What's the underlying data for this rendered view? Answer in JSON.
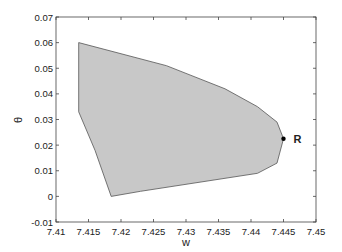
{
  "chart_data": {
    "type": "area",
    "title": "",
    "xlabel": "w",
    "ylabel": "θ",
    "xlim": [
      7.41,
      7.45
    ],
    "ylim": [
      -0.01,
      0.07
    ],
    "grid": false,
    "xticks": [
      7.41,
      7.415,
      7.42,
      7.425,
      7.43,
      7.435,
      7.44,
      7.445,
      7.45
    ],
    "yticks": [
      -0.01,
      0,
      0.01,
      0.02,
      0.03,
      0.04,
      0.05,
      0.06,
      0.07
    ],
    "xtick_labels": [
      "7.41",
      "7.415",
      "7.42",
      "7.425",
      "7.43",
      "7.435",
      "7.44",
      "7.445",
      "7.45"
    ],
    "ytick_labels": [
      "-0.01",
      "0",
      "0.01",
      "0.02",
      "0.03",
      "0.04",
      "0.05",
      "0.06",
      "0.07"
    ],
    "series": [
      {
        "name": "feasible region",
        "fill": "#c8c8c8",
        "stroke": "#555555",
        "points": [
          [
            7.4135,
            0.06
          ],
          [
            7.427,
            0.051
          ],
          [
            7.43,
            0.048
          ],
          [
            7.436,
            0.042
          ],
          [
            7.441,
            0.035
          ],
          [
            7.444,
            0.029
          ],
          [
            7.445,
            0.0225
          ],
          [
            7.444,
            0.013
          ],
          [
            7.441,
            0.009
          ],
          [
            7.423,
            0.002
          ],
          [
            7.4185,
            0.0
          ],
          [
            7.416,
            0.018
          ],
          [
            7.4135,
            0.033
          ]
        ]
      }
    ],
    "annotations": [
      {
        "label": "R",
        "x": 7.445,
        "y": 0.0225,
        "marker": "dot"
      }
    ]
  }
}
